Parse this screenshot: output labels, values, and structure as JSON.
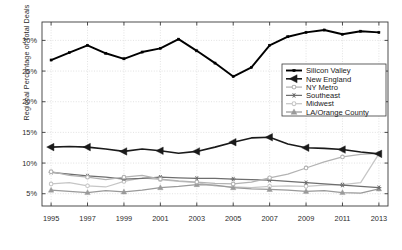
{
  "chart_data": {
    "type": "line",
    "title": "",
    "xlabel": "",
    "ylabel": "Regional Percentage of Total Deals",
    "x": [
      1995,
      1996,
      1997,
      1998,
      1999,
      2000,
      2001,
      2002,
      2003,
      2004,
      2005,
      2006,
      2007,
      2008,
      2009,
      2010,
      2011,
      2012,
      2013
    ],
    "xlim": [
      1994.5,
      2013.5
    ],
    "ylim": [
      3.0,
      33.0
    ],
    "xticks": [
      1995,
      1997,
      1999,
      2001,
      2003,
      2005,
      2007,
      2009,
      2011,
      2013
    ],
    "xticklabels": [
      "1995",
      "1997",
      "1999",
      "2001",
      "2003",
      "2005",
      "2007",
      "2009",
      "2011",
      "2013"
    ],
    "yticks": [
      5,
      10,
      15,
      20,
      25,
      30
    ],
    "yticklabels": [
      "5%",
      "10%",
      "15%",
      "20%",
      "25%",
      "30%"
    ],
    "grid": true,
    "legend_position": "right-middle",
    "series": [
      {
        "name": "Silicon Valley",
        "color": "#000000",
        "marker": "square",
        "values": [
          26.8,
          28.0,
          29.2,
          27.9,
          27.0,
          28.1,
          28.7,
          30.2,
          28.3,
          26.3,
          24.1,
          25.6,
          29.2,
          30.6,
          31.3,
          31.7,
          31.0,
          31.5,
          31.3
        ]
      },
      {
        "name": "New England",
        "color": "#1a1a1a",
        "marker": "triangle-left",
        "values": [
          12.6,
          12.7,
          12.6,
          12.3,
          11.9,
          12.3,
          12.0,
          11.6,
          11.9,
          12.6,
          13.4,
          14.1,
          14.2,
          13.1,
          12.5,
          12.4,
          12.2,
          11.8,
          11.5
        ]
      },
      {
        "name": "NY Metro",
        "color": "#b3b3b3",
        "marker": "circle",
        "values": [
          8.6,
          8.0,
          7.7,
          7.3,
          7.7,
          8.0,
          7.4,
          7.1,
          6.9,
          6.7,
          6.6,
          6.9,
          7.6,
          8.2,
          9.2,
          10.2,
          11.0,
          11.4,
          11.6
        ]
      },
      {
        "name": "Southeast",
        "color": "#6e6e6e",
        "marker": "star",
        "values": [
          8.5,
          8.2,
          7.9,
          7.7,
          7.4,
          7.5,
          7.7,
          7.6,
          7.5,
          7.5,
          7.4,
          7.3,
          7.2,
          7.0,
          6.8,
          6.6,
          6.4,
          6.2,
          6.0
        ]
      },
      {
        "name": "Midwest",
        "color": "#c6c6c6",
        "marker": "circle",
        "values": [
          6.6,
          6.8,
          6.3,
          6.1,
          7.0,
          7.6,
          7.3,
          7.0,
          6.8,
          6.3,
          6.1,
          6.0,
          6.2,
          6.3,
          6.2,
          6.4,
          6.5,
          6.8,
          11.5
        ]
      },
      {
        "name": "LA/Orange County",
        "color": "#9a9a9a",
        "marker": "triangle-up",
        "values": [
          5.6,
          5.4,
          5.2,
          5.5,
          5.3,
          5.6,
          6.0,
          6.2,
          6.5,
          6.4,
          6.0,
          5.8,
          5.7,
          5.6,
          5.4,
          5.5,
          5.2,
          5.1,
          5.8
        ]
      }
    ]
  },
  "legend": {
    "items": [
      {
        "label": "Silicon Valley"
      },
      {
        "label": "New England"
      },
      {
        "label": "NY Metro"
      },
      {
        "label": "Southeast"
      },
      {
        "label": "Midwest"
      },
      {
        "label": "LA/Orange County"
      }
    ]
  }
}
